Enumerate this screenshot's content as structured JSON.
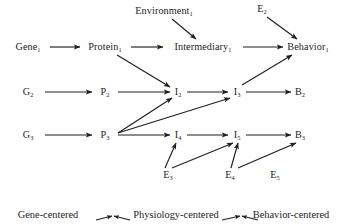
{
  "figure": {
    "type": "diagram",
    "kind": "causal-pathway-network",
    "background": "#ffffff",
    "ink_color": "#201e1e"
  },
  "nodes": [
    {
      "id": "environment1",
      "base": "Environment",
      "sub": "1",
      "x": 164,
      "y": 11,
      "tier": "environment"
    },
    {
      "id": "e2",
      "base": "E",
      "sub": "2",
      "x": 262,
      "y": 9,
      "tier": "environment"
    },
    {
      "id": "gene1",
      "base": "Gene",
      "sub": "1",
      "x": 28,
      "y": 47,
      "tier": "gene"
    },
    {
      "id": "protein1",
      "base": "Protein",
      "sub": "1",
      "x": 105,
      "y": 47,
      "tier": "protein"
    },
    {
      "id": "intermediary1",
      "base": "Intermediary",
      "sub": "1",
      "x": 203,
      "y": 47,
      "tier": "intermediary"
    },
    {
      "id": "behavior1",
      "base": "Behavior",
      "sub": "1",
      "x": 308,
      "y": 47,
      "tier": "behavior"
    },
    {
      "id": "g2",
      "base": "G",
      "sub": "2",
      "x": 28,
      "y": 92,
      "tier": "gene"
    },
    {
      "id": "p2",
      "base": "P",
      "sub": "2",
      "x": 105,
      "y": 92,
      "tier": "protein"
    },
    {
      "id": "i2",
      "base": "I",
      "sub": "2",
      "x": 178,
      "y": 92,
      "tier": "intermediary"
    },
    {
      "id": "i3",
      "base": "I",
      "sub": "3",
      "x": 237,
      "y": 92,
      "tier": "intermediary"
    },
    {
      "id": "b2",
      "base": "B",
      "sub": "2",
      "x": 300,
      "y": 92,
      "tier": "behavior"
    },
    {
      "id": "g3",
      "base": "G",
      "sub": "3",
      "x": 28,
      "y": 135,
      "tier": "gene"
    },
    {
      "id": "p3",
      "base": "P",
      "sub": "3",
      "x": 105,
      "y": 135,
      "tier": "protein"
    },
    {
      "id": "i4",
      "base": "I",
      "sub": "4",
      "x": 178,
      "y": 135,
      "tier": "intermediary"
    },
    {
      "id": "i5",
      "base": "I",
      "sub": "5",
      "x": 237,
      "y": 135,
      "tier": "intermediary"
    },
    {
      "id": "b3",
      "base": "B",
      "sub": "3",
      "x": 300,
      "y": 135,
      "tier": "behavior"
    },
    {
      "id": "e3",
      "base": "E",
      "sub": "3",
      "x": 168,
      "y": 175,
      "tier": "environment"
    },
    {
      "id": "e4",
      "base": "E",
      "sub": "4",
      "x": 230,
      "y": 175,
      "tier": "environment"
    },
    {
      "id": "e5",
      "base": "E",
      "sub": "5",
      "x": 275,
      "y": 175,
      "tier": "environment"
    }
  ],
  "edges": [
    {
      "from": "gene1",
      "to": "protein1",
      "x1": 50,
      "y1": 47,
      "x2": 80,
      "y2": 47
    },
    {
      "from": "protein1",
      "to": "intermediary1",
      "x1": 131,
      "y1": 47,
      "x2": 163,
      "y2": 47
    },
    {
      "from": "intermediary1",
      "to": "behavior1",
      "x1": 243,
      "y1": 47,
      "x2": 283,
      "y2": 47
    },
    {
      "from": "environment1",
      "to": "intermediary1",
      "x1": 172,
      "y1": 19,
      "x2": 196,
      "y2": 39
    },
    {
      "from": "e2",
      "to": "behavior1",
      "x1": 267,
      "y1": 17,
      "x2": 297,
      "y2": 39
    },
    {
      "from": "protein1",
      "to": "i2",
      "x1": 117,
      "y1": 55,
      "x2": 170,
      "y2": 87
    },
    {
      "from": "g2",
      "to": "p2",
      "x1": 45,
      "y1": 92,
      "x2": 92,
      "y2": 92
    },
    {
      "from": "p2",
      "to": "i2",
      "x1": 118,
      "y1": 92,
      "x2": 170,
      "y2": 92
    },
    {
      "from": "i2",
      "to": "i3",
      "x1": 187,
      "y1": 92,
      "x2": 228,
      "y2": 92
    },
    {
      "from": "i3",
      "to": "b2",
      "x1": 246,
      "y1": 92,
      "x2": 291,
      "y2": 92
    },
    {
      "from": "i3",
      "to": "behavior1",
      "x1": 242,
      "y1": 85,
      "x2": 292,
      "y2": 55
    },
    {
      "from": "g3",
      "to": "p3",
      "x1": 45,
      "y1": 135,
      "x2": 92,
      "y2": 135
    },
    {
      "from": "p3",
      "to": "i4",
      "x1": 118,
      "y1": 135,
      "x2": 170,
      "y2": 135
    },
    {
      "from": "p3",
      "to": "i2",
      "x1": 118,
      "y1": 133,
      "x2": 172,
      "y2": 98
    },
    {
      "from": "p3",
      "to": "i3",
      "x1": 118,
      "y1": 133,
      "x2": 230,
      "y2": 98
    },
    {
      "from": "i4",
      "to": "i5",
      "x1": 187,
      "y1": 135,
      "x2": 228,
      "y2": 135
    },
    {
      "from": "i5",
      "to": "b3",
      "x1": 246,
      "y1": 135,
      "x2": 291,
      "y2": 135
    },
    {
      "from": "e3",
      "to": "i4",
      "x1": 165,
      "y1": 168,
      "x2": 176,
      "y2": 143
    },
    {
      "from": "e3",
      "to": "i5",
      "x1": 172,
      "y1": 168,
      "x2": 233,
      "y2": 143
    },
    {
      "from": "e4",
      "to": "i5",
      "x1": 231,
      "y1": 168,
      "x2": 238,
      "y2": 143
    },
    {
      "from": "e4",
      "to": "b3",
      "x1": 238,
      "y1": 168,
      "x2": 296,
      "y2": 143
    }
  ],
  "legend": {
    "items": [
      {
        "id": "gene-centered",
        "label": "Gene-centered",
        "x": 48,
        "y": 215
      },
      {
        "id": "physiology-centered",
        "label": "Physiology-centered",
        "x": 176,
        "y": 215
      },
      {
        "id": "behavior-centered",
        "label": "Behavior-centered",
        "x": 291,
        "y": 215
      }
    ],
    "connectors": [
      {
        "id": "gene-physiology-left",
        "x1": 96,
        "y1": 220,
        "x2": 112,
        "y2": 216,
        "dir": "right"
      },
      {
        "id": "gene-physiology-right",
        "x1": 130,
        "y1": 220,
        "x2": 114,
        "y2": 216,
        "dir": "left"
      },
      {
        "id": "physiology-behavior-left",
        "x1": 222,
        "y1": 220,
        "x2": 240,
        "y2": 216,
        "dir": "right"
      },
      {
        "id": "physiology-behavior-right",
        "x1": 258,
        "y1": 220,
        "x2": 242,
        "y2": 216,
        "dir": "left"
      }
    ]
  }
}
